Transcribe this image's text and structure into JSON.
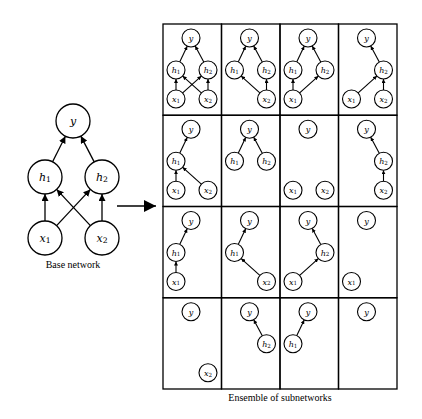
{
  "base_network": {
    "caption": "Base network",
    "nodes": [
      {
        "id": "y",
        "label": "y",
        "sub": "",
        "x": 73,
        "y": 121
      },
      {
        "id": "h1",
        "label": "h",
        "sub": "1",
        "x": 45,
        "y": 177
      },
      {
        "id": "h2",
        "label": "h",
        "sub": "2",
        "x": 102,
        "y": 177
      },
      {
        "id": "x1",
        "label": "x",
        "sub": "1",
        "x": 45,
        "y": 238
      },
      {
        "id": "x2",
        "label": "x",
        "sub": "2",
        "x": 102,
        "y": 238
      }
    ],
    "edges": [
      [
        "h1",
        "y"
      ],
      [
        "h2",
        "y"
      ],
      [
        "x1",
        "h1"
      ],
      [
        "x1",
        "h2"
      ],
      [
        "x2",
        "h1"
      ],
      [
        "x2",
        "h2"
      ]
    ],
    "radius": 17
  },
  "transition_arrow": {
    "from": [
      117,
      206
    ],
    "to": [
      156,
      206
    ]
  },
  "ensemble": {
    "caption": "Ensemble of subnetworks",
    "grid": {
      "left": 163,
      "top": 24,
      "cols": 4,
      "rows": 4,
      "cell_w": 58.5,
      "cell_h": 91.25
    },
    "node_layout": {
      "y": [
        28,
        14
      ],
      "h1": [
        13,
        46
      ],
      "h2": [
        45,
        46
      ],
      "x1": [
        13,
        75
      ],
      "x2": [
        45,
        75
      ]
    },
    "node_radius": 9,
    "cells": [
      {
        "nodes": [
          "y",
          "h1",
          "h2",
          "x1",
          "x2"
        ],
        "edges": [
          [
            "h1",
            "y"
          ],
          [
            "h2",
            "y"
          ],
          [
            "x1",
            "h1"
          ],
          [
            "x1",
            "h2"
          ],
          [
            "x2",
            "h1"
          ],
          [
            "x2",
            "h2"
          ]
        ]
      },
      {
        "nodes": [
          "y",
          "h1",
          "h2",
          "x2"
        ],
        "edges": [
          [
            "h1",
            "y"
          ],
          [
            "h2",
            "y"
          ],
          [
            "x2",
            "h1"
          ],
          [
            "x2",
            "h2"
          ]
        ]
      },
      {
        "nodes": [
          "y",
          "h1",
          "h2",
          "x1"
        ],
        "edges": [
          [
            "h1",
            "y"
          ],
          [
            "h2",
            "y"
          ],
          [
            "x1",
            "h1"
          ],
          [
            "x1",
            "h2"
          ]
        ]
      },
      {
        "nodes": [
          "y",
          "h2",
          "x1",
          "x2"
        ],
        "edges": [
          [
            "h2",
            "y"
          ],
          [
            "x1",
            "h2"
          ],
          [
            "x2",
            "h2"
          ]
        ]
      },
      {
        "nodes": [
          "y",
          "h1",
          "x1",
          "x2"
        ],
        "edges": [
          [
            "h1",
            "y"
          ],
          [
            "x1",
            "h1"
          ],
          [
            "x2",
            "h1"
          ]
        ]
      },
      {
        "nodes": [
          "y",
          "h1",
          "h2"
        ],
        "edges": [
          [
            "h1",
            "y"
          ],
          [
            "h2",
            "y"
          ]
        ]
      },
      {
        "nodes": [
          "y",
          "x1",
          "x2"
        ],
        "edges": []
      },
      {
        "nodes": [
          "y",
          "h2",
          "x2"
        ],
        "edges": [
          [
            "h2",
            "y"
          ],
          [
            "x2",
            "h2"
          ]
        ]
      },
      {
        "nodes": [
          "y",
          "h1",
          "x1"
        ],
        "edges": [
          [
            "h1",
            "y"
          ],
          [
            "x1",
            "h1"
          ]
        ]
      },
      {
        "nodes": [
          "y",
          "h1",
          "x2"
        ],
        "edges": [
          [
            "h1",
            "y"
          ],
          [
            "x2",
            "h1"
          ]
        ]
      },
      {
        "nodes": [
          "y",
          "h2",
          "x1"
        ],
        "edges": [
          [
            "h2",
            "y"
          ],
          [
            "x1",
            "h2"
          ]
        ]
      },
      {
        "nodes": [
          "y",
          "x1"
        ],
        "edges": []
      },
      {
        "nodes": [
          "y",
          "x2"
        ],
        "edges": []
      },
      {
        "nodes": [
          "y",
          "h2"
        ],
        "edges": [
          [
            "h2",
            "y"
          ]
        ]
      },
      {
        "nodes": [
          "y",
          "h1"
        ],
        "edges": [
          [
            "h1",
            "y"
          ]
        ]
      },
      {
        "nodes": [
          "y"
        ],
        "edges": []
      }
    ]
  },
  "labels": {
    "y": {
      "label": "y",
      "sub": ""
    },
    "h1": {
      "label": "h",
      "sub": "1"
    },
    "h2": {
      "label": "h",
      "sub": "2"
    },
    "x1": {
      "label": "x",
      "sub": "1"
    },
    "x2": {
      "label": "x",
      "sub": "2"
    }
  },
  "colors": {
    "stroke": "#000000",
    "background": "#ffffff"
  }
}
